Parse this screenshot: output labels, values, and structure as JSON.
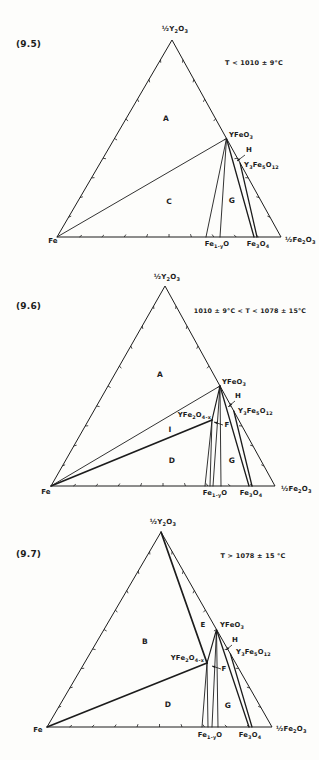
{
  "figure": {
    "background": "#fdfdfb",
    "ink": "#1c1c1c",
    "tick_fractions": [
      0.1,
      0.2,
      0.3,
      0.4,
      0.5,
      0.6,
      0.7,
      0.8,
      0.9
    ],
    "tick_len": 3
  },
  "diagrams": [
    {
      "id": "9.5",
      "height": 253,
      "triangle": {
        "top": [
          172,
          40
        ],
        "left": [
          57,
          237
        ],
        "right": [
          281,
          237
        ]
      },
      "lines": [
        {
          "name": "tie-line-fe-yfeo3",
          "pts": [
            57,
            237,
            226.5,
            138.5
          ],
          "w": 0.9
        },
        {
          "name": "tie-line-yfeo3-wustite-left",
          "pts": [
            226.5,
            138.5,
            206,
            237
          ],
          "w": 0.9
        },
        {
          "name": "tie-line-yfeo3-wustite-right",
          "pts": [
            226.5,
            138.5,
            220,
            237
          ],
          "w": 0.9
        },
        {
          "name": "tie-line-yfeo3-fe3o4",
          "pts": [
            226.5,
            138.5,
            254,
            237
          ],
          "w": 1.3
        },
        {
          "name": "tie-line-y3fe5o12-fe3o4",
          "pts": [
            240.1,
            163.1,
            257,
            237
          ],
          "w": 1.3
        }
      ],
      "labels": [
        {
          "name": "figure-number",
          "text": "(9.5)",
          "x": 16,
          "y": 47,
          "anchor": "start",
          "size": 9,
          "bold": true
        },
        {
          "name": "temperature-condition",
          "text": "T < 1010 ± 9°C",
          "x": 254,
          "y": 65,
          "anchor": "middle",
          "size": 6.5,
          "bold": true
        },
        {
          "name": "apex-label-y2o3",
          "text": "½Y~2~O~3~",
          "x": 175,
          "y": 31,
          "anchor": "middle",
          "size": 7,
          "bold": true
        },
        {
          "name": "corner-label-fe",
          "text": "Fe",
          "x": 53,
          "y": 243,
          "anchor": "middle",
          "size": 7,
          "bold": true
        },
        {
          "name": "corner-label-fe2o3",
          "text": "½Fe~2~O~3~",
          "x": 285,
          "y": 242,
          "anchor": "start",
          "size": 7,
          "bold": true
        },
        {
          "name": "phase-label-yfeo3",
          "text": "YFeO~3~",
          "x": 229,
          "y": 137,
          "anchor": "start",
          "size": 6.8,
          "bold": true
        },
        {
          "name": "region-label-h",
          "text": "H",
          "x": 249,
          "y": 152,
          "anchor": "middle",
          "size": 7,
          "bold": true
        },
        {
          "name": "phase-label-y3fe5o12",
          "text": "Y~3~Fe~5~O~12~",
          "x": 244,
          "y": 167,
          "anchor": "start",
          "size": 6.8,
          "bold": true
        },
        {
          "name": "region-label-a",
          "text": "A",
          "x": 166,
          "y": 121,
          "anchor": "middle",
          "size": 7.5,
          "bold": true
        },
        {
          "name": "region-label-c",
          "text": "C",
          "x": 169,
          "y": 204,
          "anchor": "middle",
          "size": 7.5,
          "bold": true
        },
        {
          "name": "region-label-g",
          "text": "G",
          "x": 232,
          "y": 203,
          "anchor": "middle",
          "size": 7.5,
          "bold": true
        },
        {
          "name": "axis-label-wustite",
          "text": "Fe~1-y~O",
          "x": 217,
          "y": 246,
          "anchor": "middle",
          "size": 6.8,
          "bold": true
        },
        {
          "name": "axis-label-fe3o4",
          "text": "Fe~3~O~4~",
          "x": 258,
          "y": 246,
          "anchor": "middle",
          "size": 6.8,
          "bold": true
        }
      ],
      "arrows": [
        {
          "name": "h-pointer-arrow",
          "pts": [
            245,
            155,
            237,
            161
          ]
        }
      ]
    },
    {
      "id": "9.6",
      "height": 253,
      "triangle": {
        "top": [
          165,
          33
        ],
        "left": [
          51,
          233
        ],
        "right": [
          275,
          233
        ]
      },
      "lines": [
        {
          "name": "tie-line-fe-yfeo3",
          "pts": [
            51,
            233,
            220,
            133
          ],
          "w": 0.9
        },
        {
          "name": "tie-line-fe-yfe2o4",
          "pts": [
            51,
            233,
            212,
            167
          ],
          "w": 1.7
        },
        {
          "name": "tie-line-yfeo3-yfe2o4",
          "pts": [
            220,
            133,
            212,
            167
          ],
          "w": 1.1
        },
        {
          "name": "tie-line-yfe2o4-wustite-left",
          "pts": [
            212,
            167,
            205,
            233
          ],
          "w": 0.9
        },
        {
          "name": "tie-line-yfe2o4-wustite-right",
          "pts": [
            212,
            167,
            210,
            233
          ],
          "w": 0.9
        },
        {
          "name": "tie-line-yfeo3-wustite-left",
          "pts": [
            220,
            133,
            213,
            233
          ],
          "w": 0.9
        },
        {
          "name": "tie-line-yfeo3-wustite-right",
          "pts": [
            220,
            133,
            221,
            233
          ],
          "w": 0.9
        },
        {
          "name": "tie-line-yfeo3-fe3o4",
          "pts": [
            220,
            133,
            249,
            233
          ],
          "w": 1.3
        },
        {
          "name": "tie-line-y3fe5o12-fe3o4",
          "pts": [
            233.8,
            158,
            252,
            233
          ],
          "w": 1.3
        }
      ],
      "labels": [
        {
          "name": "figure-number",
          "text": "(9.6)",
          "x": 16,
          "y": 56,
          "anchor": "start",
          "size": 9,
          "bold": true
        },
        {
          "name": "temperature-condition",
          "text": "1010 ± 9°C < T < 1078 ± 15°C",
          "x": 250,
          "y": 60,
          "anchor": "middle",
          "size": 6.3,
          "bold": true
        },
        {
          "name": "apex-label-y2o3",
          "text": "½Y~2~O~3~",
          "x": 167,
          "y": 26,
          "anchor": "middle",
          "size": 7,
          "bold": true
        },
        {
          "name": "corner-label-fe",
          "text": "Fe",
          "x": 46,
          "y": 241,
          "anchor": "middle",
          "size": 7,
          "bold": true
        },
        {
          "name": "corner-label-fe2o3",
          "text": "½Fe~2~O~3~",
          "x": 281,
          "y": 238,
          "anchor": "start",
          "size": 7,
          "bold": true
        },
        {
          "name": "phase-label-yfeo3",
          "text": "YFeO~3~",
          "x": 222,
          "y": 131,
          "anchor": "start",
          "size": 6.8,
          "bold": true
        },
        {
          "name": "region-label-h",
          "text": "H",
          "x": 238,
          "y": 145,
          "anchor": "middle",
          "size": 7,
          "bold": true
        },
        {
          "name": "phase-label-y3fe5o12",
          "text": "Y~3~Fe~5~O~12~",
          "x": 238,
          "y": 160,
          "anchor": "start",
          "size": 6.8,
          "bold": true
        },
        {
          "name": "phase-label-yfe2o4",
          "text": "YFe~2~O~4-x~",
          "x": 211,
          "y": 164,
          "anchor": "end",
          "size": 6.8,
          "bold": true
        },
        {
          "name": "region-label-f",
          "text": "F",
          "x": 227,
          "y": 174,
          "anchor": "middle",
          "size": 7,
          "bold": true
        },
        {
          "name": "region-label-i",
          "text": "I",
          "x": 170,
          "y": 179,
          "anchor": "middle",
          "size": 7.5,
          "bold": true
        },
        {
          "name": "region-label-a",
          "text": "A",
          "x": 160,
          "y": 124,
          "anchor": "middle",
          "size": 7.5,
          "bold": true
        },
        {
          "name": "region-label-d",
          "text": "D",
          "x": 172,
          "y": 210,
          "anchor": "middle",
          "size": 7.5,
          "bold": true
        },
        {
          "name": "region-label-g",
          "text": "G",
          "x": 232,
          "y": 210,
          "anchor": "middle",
          "size": 7.5,
          "bold": true
        },
        {
          "name": "axis-label-wustite",
          "text": "Fe~1-y~O",
          "x": 215,
          "y": 242,
          "anchor": "middle",
          "size": 6.8,
          "bold": true
        },
        {
          "name": "axis-label-fe3o4",
          "text": "Fe~3~O~4~",
          "x": 251,
          "y": 242,
          "anchor": "middle",
          "size": 6.8,
          "bold": true
        }
      ],
      "arrows": [
        {
          "name": "h-pointer-arrow",
          "pts": [
            235,
            148,
            229,
            153
          ]
        },
        {
          "name": "f-pointer-arrow",
          "pts": [
            223,
            172,
            214,
            169
          ]
        }
      ]
    },
    {
      "id": "9.7",
      "height": 254,
      "triangle": {
        "top": [
          161,
          26
        ],
        "left": [
          47,
          221
        ],
        "right": [
          272,
          221
        ]
      },
      "lines": [
        {
          "name": "tie-line-y2o3-yfe2o4",
          "pts": [
            161,
            26,
            207,
            157
          ],
          "w": 1.7
        },
        {
          "name": "tie-line-fe-yfe2o4",
          "pts": [
            47,
            221,
            207,
            157
          ],
          "w": 1.7
        },
        {
          "name": "tie-line-yfe2o4-yfeo3",
          "pts": [
            207,
            157,
            216.5,
            123.5
          ],
          "w": 1.1
        },
        {
          "name": "tie-line-yfe2o4-wustite-left",
          "pts": [
            207,
            157,
            202,
            221
          ],
          "w": 0.9
        },
        {
          "name": "tie-line-yfe2o4-wustite-right",
          "pts": [
            207,
            157,
            208,
            221
          ],
          "w": 0.9
        },
        {
          "name": "tie-line-yfeo3-wustite-left",
          "pts": [
            216.5,
            123.5,
            212,
            221
          ],
          "w": 0.9
        },
        {
          "name": "tie-line-yfeo3-wustite-right",
          "pts": [
            216.5,
            123.5,
            218,
            221
          ],
          "w": 0.9
        },
        {
          "name": "tie-line-yfeo3-fe3o4",
          "pts": [
            216.5,
            123.5,
            249,
            221
          ],
          "w": 1.3
        },
        {
          "name": "tie-line-y3fe5o12-fe3o4",
          "pts": [
            230.4,
            147.9,
            252,
            221
          ],
          "w": 1.3
        }
      ],
      "labels": [
        {
          "name": "figure-number",
          "text": "(9.7)",
          "x": 16,
          "y": 51,
          "anchor": "start",
          "size": 9,
          "bold": true
        },
        {
          "name": "temperature-condition",
          "text": "T > 1078 ± 15 °C",
          "x": 253,
          "y": 52,
          "anchor": "middle",
          "size": 6.5,
          "bold": true
        },
        {
          "name": "apex-label-y2o3",
          "text": "½Y~2~O~3~",
          "x": 163,
          "y": 18,
          "anchor": "middle",
          "size": 7,
          "bold": true
        },
        {
          "name": "corner-label-fe",
          "text": "Fe",
          "x": 38,
          "y": 226,
          "anchor": "middle",
          "size": 7,
          "bold": true
        },
        {
          "name": "corner-label-fe2o3",
          "text": "½Fe~2~O~3~",
          "x": 276,
          "y": 225,
          "anchor": "start",
          "size": 7,
          "bold": true
        },
        {
          "name": "region-label-e",
          "text": "E",
          "x": 203,
          "y": 121,
          "anchor": "middle",
          "size": 7,
          "bold": true
        },
        {
          "name": "phase-label-yfeo3",
          "text": "YFeO~3~",
          "x": 220,
          "y": 121,
          "anchor": "start",
          "size": 6.8,
          "bold": true
        },
        {
          "name": "region-label-h",
          "text": "H",
          "x": 235,
          "y": 136,
          "anchor": "middle",
          "size": 7,
          "bold": true
        },
        {
          "name": "phase-label-y3fe5o12",
          "text": "Y~3~Fe~5~O~12~",
          "x": 236,
          "y": 148,
          "anchor": "start",
          "size": 6.8,
          "bold": true
        },
        {
          "name": "phase-label-yfe2o4",
          "text": "YFe~2~O~4-x~",
          "x": 204,
          "y": 154,
          "anchor": "end",
          "size": 6.8,
          "bold": true
        },
        {
          "name": "region-label-f",
          "text": "F",
          "x": 224,
          "y": 165,
          "anchor": "middle",
          "size": 7,
          "bold": true
        },
        {
          "name": "region-label-b",
          "text": "B",
          "x": 145,
          "y": 138,
          "anchor": "middle",
          "size": 7.5,
          "bold": true
        },
        {
          "name": "region-label-d",
          "text": "D",
          "x": 168,
          "y": 201,
          "anchor": "middle",
          "size": 7.5,
          "bold": true
        },
        {
          "name": "region-label-g",
          "text": "G",
          "x": 228,
          "y": 202,
          "anchor": "middle",
          "size": 7.5,
          "bold": true
        },
        {
          "name": "axis-label-wustite",
          "text": "Fe~1-y~O",
          "x": 210,
          "y": 231,
          "anchor": "middle",
          "size": 6.8,
          "bold": true
        },
        {
          "name": "axis-label-fe3o4",
          "text": "Fe~3~O~4~",
          "x": 250,
          "y": 231,
          "anchor": "middle",
          "size": 6.8,
          "bold": true
        }
      ],
      "arrows": [
        {
          "name": "h-pointer-arrow",
          "pts": [
            232,
            139,
            226,
            144
          ]
        },
        {
          "name": "f-pointer-arrow",
          "pts": [
            221,
            163,
            212,
            160
          ]
        }
      ]
    }
  ]
}
